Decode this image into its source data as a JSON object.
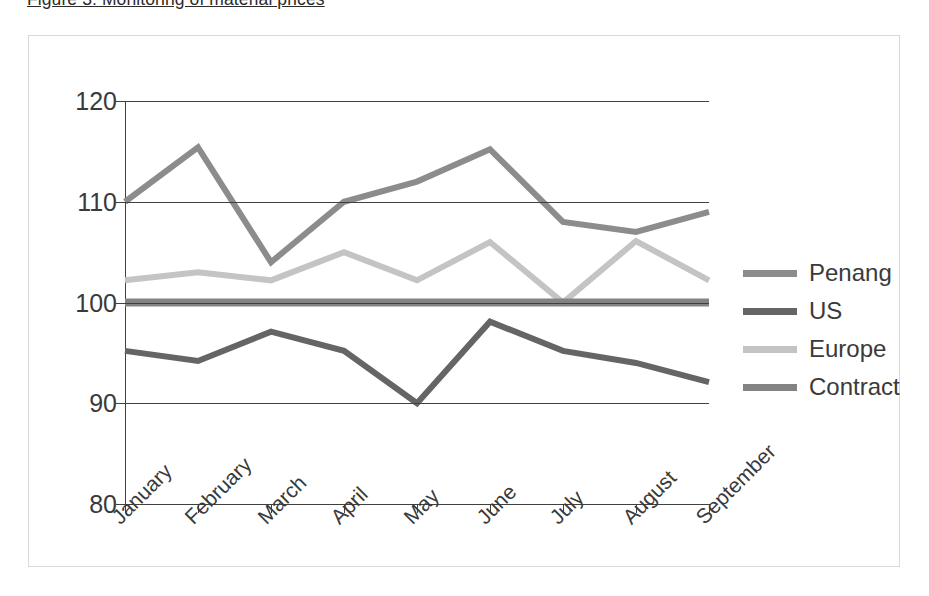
{
  "figure": {
    "caption": "Figure 3: Monitoring of material prices"
  },
  "legend": {
    "position": "right",
    "items": [
      {
        "label": "Penang",
        "color": "#8c8c8c"
      },
      {
        "label": "US",
        "color": "#656565"
      },
      {
        "label": "Europe",
        "color": "#c4c4c4"
      },
      {
        "label": "Contract",
        "color": "#838383"
      }
    ]
  },
  "axes": {
    "y_ticks": [
      "120",
      "110",
      "100",
      "90",
      "80"
    ],
    "x_ticks": [
      "January",
      "February",
      "March",
      "April",
      "May",
      "June",
      "July",
      "August",
      "September"
    ]
  },
  "chart_data": {
    "type": "line",
    "title": "Figure 3: Monitoring of material prices",
    "xlabel": "",
    "ylabel": "",
    "ylim": [
      80,
      120
    ],
    "ytick_step": 10,
    "grid": true,
    "legend_position": "right",
    "categories": [
      "January",
      "February",
      "March",
      "April",
      "May",
      "June",
      "July",
      "August",
      "September"
    ],
    "series": [
      {
        "name": "Penang",
        "color": "#8c8c8c",
        "values": [
          110,
          115.4,
          104,
          110,
          112,
          115.2,
          108,
          107,
          109
        ]
      },
      {
        "name": "US",
        "color": "#656565",
        "values": [
          95.2,
          94.2,
          97.1,
          95.2,
          90,
          98.1,
          95.2,
          94,
          92.1
        ]
      },
      {
        "name": "Europe",
        "color": "#c4c4c4",
        "values": [
          102.2,
          103,
          102.2,
          105,
          102.2,
          106,
          100,
          106.1,
          102.2
        ]
      },
      {
        "name": "Contract",
        "color": "#838383",
        "values": [
          100,
          100,
          100,
          100,
          100,
          100,
          100,
          100,
          100
        ]
      }
    ]
  }
}
